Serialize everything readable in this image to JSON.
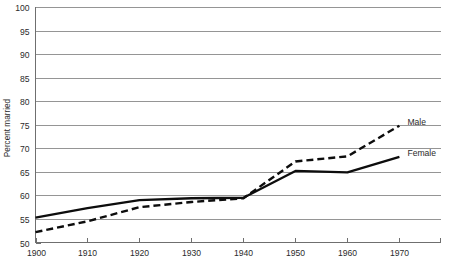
{
  "chart_data": {
    "type": "line",
    "title": "",
    "subtitle": "",
    "xlabel": "",
    "ylabel": "Percent married",
    "x": [
      1900,
      1910,
      1920,
      1930,
      1940,
      1950,
      1960,
      1970
    ],
    "xlim": [
      1900,
      1978
    ],
    "ylim": [
      50,
      100
    ],
    "grid": true,
    "legend_position": "right-inline",
    "x_ticks": [
      "1900",
      "1910",
      "1920",
      "1930",
      "1940",
      "1950",
      "1960",
      "1970"
    ],
    "y_ticks": [
      "50",
      "55",
      "60",
      "65",
      "70",
      "75",
      "80",
      "85",
      "90",
      "95",
      "100"
    ],
    "series": [
      {
        "name": "Male",
        "style": "dashed",
        "color": "#0d0d0d",
        "values": [
          52.2,
          54.5,
          57.5,
          58.6,
          59.4,
          67.2,
          68.3,
          74.8
        ],
        "label": "Male",
        "label_value": 74.8
      },
      {
        "name": "Female",
        "style": "solid",
        "color": "#0d0d0d",
        "values": [
          55.3,
          57.3,
          59.0,
          59.4,
          59.5,
          65.2,
          64.9,
          68.2
        ],
        "label": "Female",
        "label_value": 68.2
      }
    ]
  },
  "axes": {
    "y_title": "Percent married"
  },
  "colors": {
    "line": "#0d0d0d",
    "grid": "#8a8a8a",
    "axis": "#6f6f6f",
    "text": "#2b2b2b",
    "background": "#ffffff"
  }
}
